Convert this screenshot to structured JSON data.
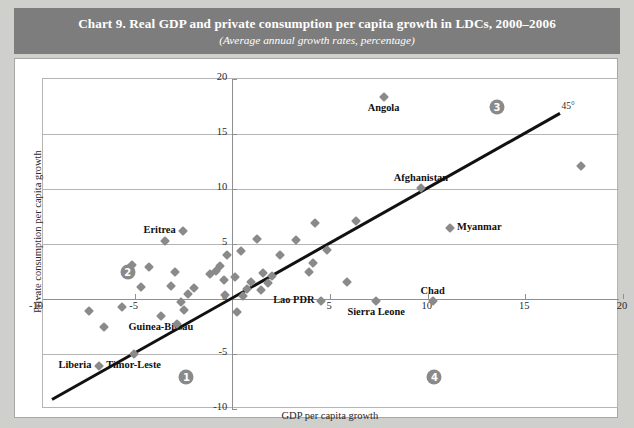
{
  "banner": {
    "title": "Chart 9.  Real GDP and private consumption per capita growth in LDCs, 2000–2006",
    "subtitle": "(Average annual growth rates, percentage)"
  },
  "chart_data": {
    "type": "scatter",
    "title": "Chart 9.  Real GDP and private consumption per capita growth in LDCs, 2000–2006",
    "subtitle": "(Average annual growth rates, percentage)",
    "xlabel": "GDP per capita growth",
    "ylabel": "Private consumption per capita growth",
    "xlim": [
      -10,
      20
    ],
    "ylim": [
      -10,
      20
    ],
    "xticks": [
      "-10",
      "-5",
      "0",
      "5",
      "10",
      "15",
      "20"
    ],
    "yticks": [
      "-10",
      "-5",
      "0",
      "5",
      "10",
      "15",
      "20"
    ],
    "xtick_values": [
      -10,
      -5,
      0,
      5,
      10,
      15,
      20
    ],
    "ytick_values": [
      -10,
      -5,
      0,
      5,
      10,
      15,
      20
    ],
    "grid": true,
    "legend": "none",
    "marker_color": "#8a8a8a",
    "marker_shape": "diamond",
    "reference_line": {
      "label": "45°",
      "slope": 1,
      "intercept": 0,
      "x_start": -9.2,
      "x_end": 16.8,
      "color": "#111111"
    },
    "quadrant_badges": [
      {
        "id": "1",
        "text": "1",
        "x": -2.3,
        "y": -7.2
      },
      {
        "id": "2",
        "text": "2",
        "x": -5.3,
        "y": 2.4
      },
      {
        "id": "3",
        "text": "3",
        "x": 13.6,
        "y": 17.4
      },
      {
        "id": "4",
        "text": "4",
        "x": 10.4,
        "y": -7.2
      }
    ],
    "points": [
      {
        "label": "Angola",
        "x": 7.8,
        "y": 18.3,
        "label_pos": "below"
      },
      {
        "label": "Afghanistan",
        "x": 9.7,
        "y": 10.0,
        "label_pos": "above"
      },
      {
        "label": "Myanmar",
        "x": 11.2,
        "y": 6.4,
        "label_pos": "right"
      },
      {
        "label": "Eritrea",
        "x": -2.5,
        "y": 6.1,
        "label_pos": "left"
      },
      {
        "label": "Chad",
        "x": 10.3,
        "y": -0.3,
        "label_pos": "above"
      },
      {
        "label": "Sierra Leone",
        "x": 7.4,
        "y": -0.3,
        "label_pos": "below"
      },
      {
        "label": "Lao PDR",
        "x": 4.6,
        "y": -0.3,
        "label_pos": "left"
      },
      {
        "label": "Guinea-Bissau",
        "x": -3.6,
        "y": -1.6,
        "label_pos": "below"
      },
      {
        "label": "Liberia",
        "x": -6.8,
        "y": -6.2,
        "label_pos": "left"
      },
      {
        "label": "Timor-Leste",
        "x": -5.0,
        "y": -5.1,
        "label_pos": "below"
      },
      {
        "label": "",
        "x": 17.9,
        "y": 12.0
      },
      {
        "label": "",
        "x": -3.4,
        "y": 5.2
      },
      {
        "label": "",
        "x": 1.3,
        "y": 5.4
      },
      {
        "label": "",
        "x": 3.3,
        "y": 5.3
      },
      {
        "label": "",
        "x": 0.5,
        "y": 4.3
      },
      {
        "label": "",
        "x": -0.2,
        "y": 3.9
      },
      {
        "label": "",
        "x": 2.5,
        "y": 3.9
      },
      {
        "label": "",
        "x": -5.1,
        "y": 3.0
      },
      {
        "label": "",
        "x": -4.2,
        "y": 2.8
      },
      {
        "label": "",
        "x": -0.6,
        "y": 2.9
      },
      {
        "label": "",
        "x": -0.8,
        "y": 2.5
      },
      {
        "label": "",
        "x": -2.9,
        "y": 2.4
      },
      {
        "label": "",
        "x": -1.1,
        "y": 2.2
      },
      {
        "label": "",
        "x": 1.6,
        "y": 2.3
      },
      {
        "label": "",
        "x": 2.1,
        "y": 2.0
      },
      {
        "label": "",
        "x": 0.2,
        "y": 1.9
      },
      {
        "label": "",
        "x": -0.4,
        "y": 1.6
      },
      {
        "label": "",
        "x": 1.0,
        "y": 1.5
      },
      {
        "label": "",
        "x": 1.9,
        "y": 1.4
      },
      {
        "label": "",
        "x": 5.9,
        "y": 1.5
      },
      {
        "label": "",
        "x": -4.6,
        "y": 1.0
      },
      {
        "label": "",
        "x": -3.1,
        "y": 1.1
      },
      {
        "label": "",
        "x": -1.9,
        "y": 0.9
      },
      {
        "label": "",
        "x": 0.8,
        "y": 0.8
      },
      {
        "label": "",
        "x": 1.5,
        "y": 0.7
      },
      {
        "label": "",
        "x": -2.2,
        "y": 0.4
      },
      {
        "label": "",
        "x": -0.3,
        "y": 0.3
      },
      {
        "label": "",
        "x": 0.6,
        "y": 0.2
      },
      {
        "label": "",
        "x": -2.6,
        "y": -0.4
      },
      {
        "label": "",
        "x": -5.6,
        "y": -0.8
      },
      {
        "label": "",
        "x": -7.3,
        "y": -1.2
      },
      {
        "label": "",
        "x": -2.4,
        "y": -1.1
      },
      {
        "label": "",
        "x": 0.3,
        "y": -1.3
      },
      {
        "label": "",
        "x": -2.8,
        "y": -2.4
      },
      {
        "label": "",
        "x": -6.5,
        "y": -2.6
      },
      {
        "label": "",
        "x": 6.4,
        "y": 7.0
      },
      {
        "label": "",
        "x": 4.3,
        "y": 6.8
      },
      {
        "label": "",
        "x": 4.9,
        "y": 4.4
      },
      {
        "label": "",
        "x": 4.2,
        "y": 3.2
      },
      {
        "label": "",
        "x": 4.0,
        "y": 2.4
      }
    ]
  }
}
